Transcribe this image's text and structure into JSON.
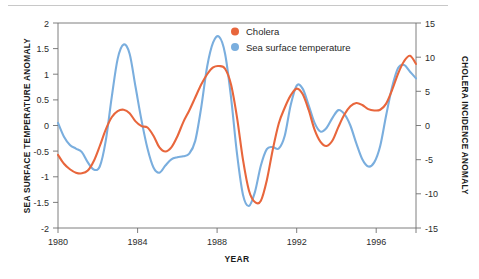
{
  "figure": {
    "background_color": "#ffffff",
    "top_rule": true
  },
  "legend": {
    "position": "top-center-right",
    "entries": [
      {
        "label": "Cholera",
        "color": "#e8663c",
        "marker": "legend-dot-cholera"
      },
      {
        "label": "Sea surface temperature",
        "color": "#7aaede",
        "marker": "legend-dot-sst"
      }
    ]
  },
  "chart_data": {
    "type": "line",
    "title": "",
    "subtitle": "",
    "xlabel": "YEAR",
    "ylabel": "SEA SURFACE TEMPERATURE ANOMALY",
    "y2label": "CHOLERA INCIDENCE ANOMALY",
    "grid": false,
    "legend_position": "top-center",
    "xlim": [
      1980,
      1998
    ],
    "ylim": [
      -2,
      2
    ],
    "y2lim": [
      -15,
      15
    ],
    "xticks": [
      1980,
      1984,
      1988,
      1992,
      1996
    ],
    "xtick_labels": [
      "1980",
      "1984",
      "1988",
      "1992",
      "1996"
    ],
    "yticks": [
      2,
      1.5,
      1,
      0.5,
      0,
      -0.5,
      -1,
      -1.5,
      -2
    ],
    "ytick_labels": [
      "2",
      "1.5",
      "1",
      "0.5",
      "0",
      "-0.5",
      "-1",
      "-1.5",
      "-2"
    ],
    "y2ticks": [
      15,
      10,
      5,
      0,
      -5,
      -10,
      -15
    ],
    "y2tick_labels": [
      "15",
      "10",
      "5",
      "0",
      "-5",
      "-10",
      "-15"
    ],
    "series": [
      {
        "name": "Sea surface temperature",
        "color": "#7aaede",
        "axis": "left",
        "units": "temperature anomaly (°C)",
        "x": [
          1980.0,
          1980.3,
          1980.6,
          1980.9,
          1981.2,
          1981.5,
          1981.8,
          1982.1,
          1982.4,
          1982.7,
          1983.0,
          1983.3,
          1983.6,
          1983.9,
          1984.2,
          1984.5,
          1984.8,
          1985.1,
          1985.4,
          1985.7,
          1986.0,
          1986.3,
          1986.6,
          1986.9,
          1987.2,
          1987.5,
          1987.8,
          1988.1,
          1988.4,
          1988.7,
          1989.0,
          1989.3,
          1989.6,
          1989.9,
          1990.2,
          1990.5,
          1990.8,
          1991.1,
          1991.4,
          1991.7,
          1992.0,
          1992.3,
          1992.6,
          1992.9,
          1993.2,
          1993.5,
          1993.8,
          1994.1,
          1994.4,
          1994.7,
          1995.0,
          1995.3,
          1995.6,
          1995.9,
          1996.2,
          1996.5,
          1996.8,
          1997.1,
          1997.4,
          1997.7,
          1998.0
        ],
        "y": [
          0.05,
          -0.22,
          -0.38,
          -0.45,
          -0.52,
          -0.72,
          -0.86,
          -0.8,
          -0.3,
          0.55,
          1.3,
          1.58,
          1.4,
          0.75,
          0.1,
          -0.45,
          -0.82,
          -0.92,
          -0.78,
          -0.66,
          -0.62,
          -0.6,
          -0.55,
          -0.3,
          0.35,
          1.15,
          1.62,
          1.73,
          1.4,
          0.55,
          -0.55,
          -1.35,
          -1.57,
          -1.3,
          -0.78,
          -0.46,
          -0.42,
          -0.45,
          -0.2,
          0.4,
          0.78,
          0.72,
          0.4,
          0.05,
          -0.12,
          -0.05,
          0.15,
          0.3,
          0.22,
          0.0,
          -0.35,
          -0.66,
          -0.8,
          -0.72,
          -0.4,
          0.2,
          0.75,
          1.12,
          1.18,
          1.05,
          0.92
        ]
      },
      {
        "name": "Cholera",
        "color": "#e8663c",
        "axis": "right",
        "units": "incidence anomaly",
        "x": [
          1980.0,
          1980.3,
          1980.6,
          1980.9,
          1981.2,
          1981.5,
          1981.8,
          1982.1,
          1982.4,
          1982.7,
          1983.0,
          1983.3,
          1983.6,
          1983.9,
          1984.2,
          1984.5,
          1984.8,
          1985.1,
          1985.4,
          1985.7,
          1986.0,
          1986.3,
          1986.6,
          1986.9,
          1987.2,
          1987.5,
          1987.8,
          1988.1,
          1988.4,
          1988.7,
          1989.0,
          1989.3,
          1989.6,
          1989.9,
          1990.2,
          1990.5,
          1990.8,
          1991.1,
          1991.4,
          1991.7,
          1992.0,
          1992.3,
          1992.6,
          1992.9,
          1993.2,
          1993.5,
          1993.8,
          1994.1,
          1994.4,
          1994.7,
          1995.0,
          1995.3,
          1995.6,
          1995.9,
          1996.2,
          1996.5,
          1996.8,
          1997.1,
          1997.4,
          1997.7,
          1998.0
        ],
        "y": [
          -4.3,
          -5.6,
          -6.4,
          -6.9,
          -7.0,
          -6.6,
          -5.2,
          -3.0,
          -0.6,
          1.2,
          2.1,
          2.3,
          1.8,
          0.6,
          -0.1,
          -0.3,
          -1.5,
          -3.2,
          -3.8,
          -3.2,
          -1.6,
          0.5,
          2.2,
          4.1,
          6.0,
          7.5,
          8.5,
          8.7,
          8.3,
          6.0,
          1.2,
          -5.0,
          -9.5,
          -11.2,
          -11.0,
          -8.0,
          -3.5,
          0.3,
          2.6,
          4.4,
          5.4,
          4.6,
          2.3,
          -0.6,
          -2.4,
          -3.0,
          -2.2,
          -0.2,
          1.6,
          2.8,
          3.3,
          3.0,
          2.4,
          2.2,
          2.3,
          3.2,
          5.2,
          7.6,
          9.4,
          10.2,
          9.0
        ]
      }
    ]
  }
}
